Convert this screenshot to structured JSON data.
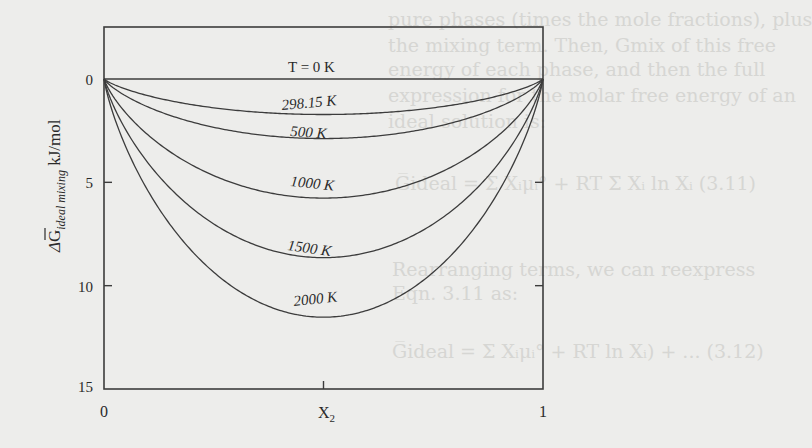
{
  "chart_data": {
    "type": "line",
    "title": "",
    "xlabel": "X₂",
    "ylabel": "ΔG̅ ideal mixing kJ/mol",
    "ylabel_main": "ΔG",
    "ylabel_sub": "ideal mixing",
    "ylabel_unit": "kJ/mol",
    "xlim": [
      0,
      1
    ],
    "ylim": [
      0,
      15
    ],
    "y_inverted": true,
    "x_ticks": [
      0,
      0.5,
      1
    ],
    "x_tick_labels": [
      "0",
      "X₂",
      "1"
    ],
    "y_ticks": [
      0,
      5,
      10,
      15
    ],
    "y_tick_labels": [
      "0",
      "5",
      "10",
      "15"
    ],
    "grid": false,
    "legend": "inline labels",
    "formula_note": "Magnitude of -RT[x ln x + (1-x) ln(1-x)], R = 8.314 J/mol·K",
    "x": [
      0,
      0.1,
      0.2,
      0.3,
      0.4,
      0.5,
      0.6,
      0.7,
      0.8,
      0.9,
      1
    ],
    "series": [
      {
        "name": "T = 0 K",
        "T": 0,
        "label": "T = 0 K",
        "values": [
          0,
          0,
          0,
          0,
          0,
          0,
          0,
          0,
          0,
          0,
          0
        ]
      },
      {
        "name": "298.15 K",
        "T": 298.15,
        "label": "298.15 K",
        "values": [
          0,
          0.81,
          1.24,
          1.51,
          1.67,
          1.72,
          1.67,
          1.51,
          1.24,
          0.81,
          0
        ]
      },
      {
        "name": "500 K",
        "T": 500,
        "label": "500 K",
        "values": [
          0,
          1.35,
          2.08,
          2.54,
          2.8,
          2.88,
          2.8,
          2.54,
          2.08,
          1.35,
          0
        ]
      },
      {
        "name": "1000 K",
        "T": 1000,
        "label": "1000 K",
        "values": [
          0,
          2.7,
          4.16,
          5.08,
          5.6,
          5.76,
          5.6,
          5.08,
          4.16,
          2.7,
          0
        ]
      },
      {
        "name": "1500 K",
        "T": 1500,
        "label": "1500 K",
        "values": [
          0,
          4.05,
          6.24,
          7.62,
          8.39,
          8.64,
          8.39,
          7.62,
          6.24,
          4.05,
          0
        ]
      },
      {
        "name": "2000 K",
        "T": 2000,
        "label": "2000 K",
        "values": [
          0,
          5.41,
          8.32,
          10.16,
          11.19,
          11.53,
          11.19,
          10.16,
          8.32,
          5.41,
          0
        ]
      }
    ]
  },
  "background_text": {
    "lines": [
      "pure phases (times the mole fractions), plus",
      "the mixing term. Then, Gmix of this free",
      "energy of each phase, and then the full",
      "expression for the molar free energy of an",
      "ideal solution is:",
      "G̅ideal = Σ Xᵢμᵢ° + RT Σ Xᵢ ln Xᵢ   (3.11)",
      "Rearranging terms, we can reexpress",
      "Eqn. 3.11 as:",
      "G̅ideal = Σ Xᵢμᵢ° + RT ln Xᵢ) + ... (3.12)"
    ]
  },
  "colors": {
    "background": "#ededeb",
    "line": "#3c3c3c",
    "text": "#2a2a2a",
    "bleed_text": "#d6d6d3"
  }
}
